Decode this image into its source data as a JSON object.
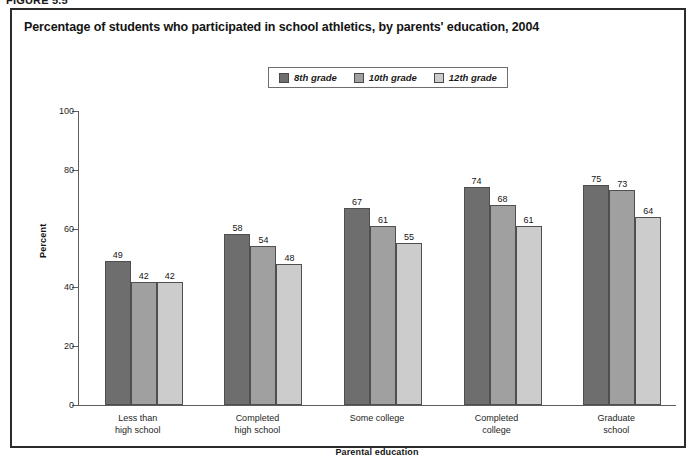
{
  "figure": {
    "label": "FIGURE 5.5"
  },
  "chart_data": {
    "type": "bar",
    "title": "Percentage of students who participated in school athletics, by parents' education, 2004",
    "xlabel": "Parental education",
    "ylabel": "Percent",
    "ylim": [
      0,
      100
    ],
    "yticks": [
      0,
      20,
      40,
      60,
      80,
      100
    ],
    "ytick_labels": [
      "0",
      "20",
      "40",
      "60",
      "80",
      "100"
    ],
    "grid": false,
    "legend_position": "top-center",
    "categories": [
      "Less than\nhigh school",
      "Completed\nhigh school",
      "Some college",
      "Completed\ncollege",
      "Graduate\nschool"
    ],
    "category_lines": [
      [
        "Less than",
        "high school"
      ],
      [
        "Completed",
        "high school"
      ],
      [
        "Some college",
        ""
      ],
      [
        "Completed",
        "college"
      ],
      [
        "Graduate",
        "school"
      ]
    ],
    "series": [
      {
        "name": "8th grade",
        "color": "#6e6e6e",
        "values": [
          49,
          58,
          67,
          74,
          75
        ]
      },
      {
        "name": "10th grade",
        "color": "#a0a0a0",
        "values": [
          42,
          54,
          61,
          68,
          73
        ]
      },
      {
        "name": "12th grade",
        "color": "#cccccc",
        "values": [
          42,
          48,
          55,
          61,
          64
        ]
      }
    ]
  },
  "colors": {
    "panel_border": "#2b2b2b",
    "axis": "#5d5d5d",
    "text": "#141414",
    "series_8th": "#6e6e6e",
    "series_10th": "#a0a0a0",
    "series_12th": "#cccccc"
  }
}
